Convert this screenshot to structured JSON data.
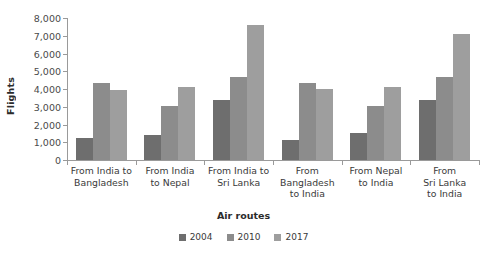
{
  "chart_data": {
    "type": "bar",
    "title": "",
    "xlabel": "Air routes",
    "ylabel": "Flights",
    "ylim": [
      0,
      8000
    ],
    "yticks": [
      "0",
      "1,000",
      "2,000",
      "3,000",
      "4,000",
      "5,000",
      "6,000",
      "7,000",
      "8,000"
    ],
    "ytick_values": [
      0,
      1000,
      2000,
      3000,
      4000,
      5000,
      6000,
      7000,
      8000
    ],
    "grid": false,
    "legend_position": "bottom",
    "categories": [
      "From India to Bangladesh",
      "From India to Nepal",
      "From India to Sri Lanka",
      "From Bangladesh to India",
      "From Nepal to India",
      "From Sri Lanka to India"
    ],
    "category_lines": [
      [
        "From India to",
        "Bangladesh"
      ],
      [
        "From India",
        "to Nepal"
      ],
      [
        "From India to",
        "Sri Lanka"
      ],
      [
        "From",
        "Bangladesh",
        "to India"
      ],
      [
        "From Nepal",
        "to India"
      ],
      [
        "From",
        "Sri Lanka",
        "to India"
      ]
    ],
    "series": [
      {
        "name": "2004",
        "color": "#6e6e6e",
        "values": [
          1250,
          1400,
          3400,
          1150,
          1500,
          3400
        ]
      },
      {
        "name": "2010",
        "color": "#8c8c8c",
        "values": [
          4350,
          3050,
          4650,
          4350,
          3050,
          4650
        ]
      },
      {
        "name": "2017",
        "color": "#9e9e9e",
        "values": [
          3950,
          4100,
          7600,
          4000,
          4100,
          7100
        ]
      }
    ]
  },
  "axis": {
    "y_title": "Flights",
    "x_title": "Air routes"
  }
}
